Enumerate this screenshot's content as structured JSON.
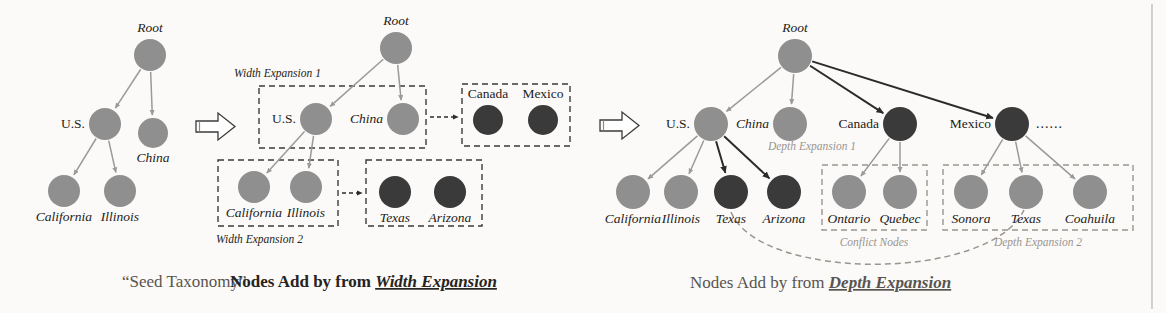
{
  "figure": {
    "colors": {
      "node_light": "#8f8f8f",
      "node_dark": "#3a3a3a",
      "edge_light": "#9a9a9a",
      "edge_dark": "#2b2b2b",
      "dash_box": "#3a3a3a",
      "dash_box_grey": "#9a958f",
      "caption_grey": "#9a958f",
      "caption_dark": "#262320",
      "background": "#fbfaf8"
    }
  },
  "panels": [
    {
      "id": "seed",
      "caption": "“Seed Taxonomy”",
      "caption_style": "grey",
      "nodes": [
        {
          "name": "Root",
          "label": "Root",
          "x": 150,
          "y": 55,
          "r": 16,
          "tone": "light",
          "label_pos": "above"
        },
        {
          "name": "US",
          "label": "U.S.",
          "x": 105,
          "y": 124,
          "r": 16,
          "tone": "light",
          "label_pos": "left"
        },
        {
          "name": "China",
          "label": "China",
          "x": 153,
          "y": 133,
          "r": 15,
          "tone": "light",
          "label_pos": "below"
        },
        {
          "name": "California",
          "label": "California",
          "x": 64,
          "y": 191,
          "r": 16,
          "tone": "light",
          "label_pos": "below"
        },
        {
          "name": "Illinois",
          "label": "Illinois",
          "x": 120,
          "y": 191,
          "r": 16,
          "tone": "light",
          "label_pos": "below"
        }
      ],
      "edges": [
        {
          "from": "Root",
          "to": "US",
          "tone": "light"
        },
        {
          "from": "Root",
          "to": "China",
          "tone": "light"
        },
        {
          "from": "US",
          "to": "California",
          "tone": "light"
        },
        {
          "from": "US",
          "to": "Illinois",
          "tone": "light"
        }
      ]
    },
    {
      "id": "width-expansion",
      "caption_prefix": "Nodes Add by from ",
      "caption_emphasis": "Width Expansion",
      "caption_style": "bold",
      "nodes": [
        {
          "name": "Root",
          "label": "Root",
          "x": 396,
          "y": 48,
          "r": 16,
          "tone": "light",
          "label_pos": "above"
        },
        {
          "name": "US",
          "label": "U.S.",
          "x": 316,
          "y": 119,
          "r": 16,
          "tone": "light",
          "label_pos": "left"
        },
        {
          "name": "China",
          "label": "China",
          "x": 403,
          "y": 119,
          "r": 16,
          "tone": "light",
          "label_pos": "left"
        },
        {
          "name": "Canada",
          "label": "Canada",
          "x": 488,
          "y": 120,
          "r": 15,
          "tone": "dark",
          "label_pos": "above"
        },
        {
          "name": "Mexico",
          "label": "Mexico",
          "x": 543,
          "y": 120,
          "r": 15,
          "tone": "dark",
          "label_pos": "above"
        },
        {
          "name": "California",
          "label": "California",
          "x": 254,
          "y": 187,
          "r": 16,
          "tone": "light",
          "label_pos": "below"
        },
        {
          "name": "Illinois",
          "label": "Illinois",
          "x": 306,
          "y": 187,
          "r": 16,
          "tone": "light",
          "label_pos": "below"
        },
        {
          "name": "Texas",
          "label": "Texas",
          "x": 395,
          "y": 192,
          "r": 16,
          "tone": "dark",
          "label_pos": "below"
        },
        {
          "name": "Arizona",
          "label": "Arizona",
          "x": 450,
          "y": 192,
          "r": 16,
          "tone": "dark",
          "label_pos": "below"
        }
      ],
      "edges": [
        {
          "from": "Root",
          "to": "US",
          "tone": "light"
        },
        {
          "from": "Root",
          "to": "China",
          "tone": "light"
        },
        {
          "from": "US",
          "to": "California",
          "tone": "light"
        },
        {
          "from": "US",
          "to": "Illinois",
          "tone": "light"
        }
      ],
      "boxes": [
        {
          "name": "width-expansion-1-box",
          "x": 259,
          "y": 86,
          "w": 167,
          "h": 62,
          "label": "Width Expansion 1",
          "label_x": 234,
          "label_y": 77,
          "label_anchor": "start",
          "tone": "dark"
        },
        {
          "name": "new-top-nodes-box",
          "x": 462,
          "y": 84,
          "w": 108,
          "h": 62,
          "label": "",
          "tone": "dark"
        },
        {
          "name": "width-expansion-2-box",
          "x": 218,
          "y": 160,
          "w": 120,
          "h": 66,
          "label": "Width Expansion 2",
          "label_x": 216,
          "label_y": 243,
          "label_anchor": "start",
          "tone": "dark"
        },
        {
          "name": "new-leaf-nodes-box",
          "x": 366,
          "y": 160,
          "w": 116,
          "h": 66,
          "label": "",
          "tone": "dark"
        }
      ],
      "dashed_arrows": [
        {
          "name": "top-expansion-arrow",
          "x1": 430,
          "y1": 117,
          "x2": 458,
          "y2": 117
        },
        {
          "name": "leaf-expansion-arrow",
          "x1": 342,
          "y1": 193,
          "x2": 362,
          "y2": 193
        }
      ]
    },
    {
      "id": "depth-expansion",
      "caption_prefix": "Nodes Add by from ",
      "caption_emphasis": "Depth Expansion",
      "caption_style": "grey",
      "ellipsis": {
        "text": "......",
        "x": 1036,
        "y": 128
      },
      "nodes": [
        {
          "name": "Root",
          "label": "Root",
          "x": 795,
          "y": 56,
          "r": 17,
          "tone": "light",
          "label_pos": "above"
        },
        {
          "name": "US",
          "label": "U.S.",
          "x": 711,
          "y": 124,
          "r": 17,
          "tone": "light",
          "label_pos": "left"
        },
        {
          "name": "China",
          "label": "China",
          "x": 790,
          "y": 124,
          "r": 17,
          "tone": "light",
          "label_pos": "left"
        },
        {
          "name": "Canada",
          "label": "Canada",
          "x": 900,
          "y": 124,
          "r": 17,
          "tone": "dark",
          "label_pos": "left"
        },
        {
          "name": "Mexico",
          "label": "Mexico",
          "x": 1012,
          "y": 124,
          "r": 17,
          "tone": "dark",
          "label_pos": "left"
        },
        {
          "name": "California",
          "label": "California",
          "x": 633,
          "y": 192,
          "r": 17,
          "tone": "light",
          "label_pos": "below"
        },
        {
          "name": "Illinois",
          "label": "Illinois",
          "x": 681,
          "y": 192,
          "r": 17,
          "tone": "light",
          "label_pos": "below"
        },
        {
          "name": "TexasUS",
          "label": "Texas",
          "x": 731,
          "y": 192,
          "r": 17,
          "tone": "dark",
          "label_pos": "below"
        },
        {
          "name": "Arizona",
          "label": "Arizona",
          "x": 784,
          "y": 192,
          "r": 17,
          "tone": "dark",
          "label_pos": "below"
        },
        {
          "name": "Ontario",
          "label": "Ontario",
          "x": 849,
          "y": 192,
          "r": 17,
          "tone": "light",
          "label_pos": "below"
        },
        {
          "name": "Quebec",
          "label": "Quebec",
          "x": 900,
          "y": 192,
          "r": 17,
          "tone": "light",
          "label_pos": "below"
        },
        {
          "name": "Sonora",
          "label": "Sonora",
          "x": 971,
          "y": 192,
          "r": 17,
          "tone": "light",
          "label_pos": "below"
        },
        {
          "name": "TexasMX",
          "label": "Texas",
          "x": 1026,
          "y": 192,
          "r": 17,
          "tone": "light",
          "label_pos": "below"
        },
        {
          "name": "Coahuila",
          "label": "Coahuila",
          "x": 1090,
          "y": 192,
          "r": 17,
          "tone": "light",
          "label_pos": "below"
        }
      ],
      "edges": [
        {
          "from": "Root",
          "to": "US",
          "tone": "light"
        },
        {
          "from": "Root",
          "to": "China",
          "tone": "light"
        },
        {
          "from": "Root",
          "to": "Canada",
          "tone": "dark"
        },
        {
          "from": "Root",
          "to": "Mexico",
          "tone": "dark"
        },
        {
          "from": "US",
          "to": "California",
          "tone": "light"
        },
        {
          "from": "US",
          "to": "Illinois",
          "tone": "light"
        },
        {
          "from": "US",
          "to": "TexasUS",
          "tone": "dark"
        },
        {
          "from": "US",
          "to": "Arizona",
          "tone": "dark"
        },
        {
          "from": "Canada",
          "to": "Ontario",
          "tone": "light"
        },
        {
          "from": "Canada",
          "to": "Quebec",
          "tone": "light"
        },
        {
          "from": "Mexico",
          "to": "Sonora",
          "tone": "light"
        },
        {
          "from": "Mexico",
          "to": "TexasMX",
          "tone": "light"
        },
        {
          "from": "Mexico",
          "to": "Coahuila",
          "tone": "light"
        }
      ],
      "boxes": [
        {
          "name": "conflict-nodes-box",
          "x": 822,
          "y": 165,
          "w": 105,
          "h": 65,
          "label": "Conflict Nodes",
          "label_x": 874,
          "label_y": 246,
          "label_anchor": "middle",
          "tone": "grey"
        },
        {
          "name": "depth-expansion-2-box",
          "x": 943,
          "y": 165,
          "w": 190,
          "h": 65,
          "label": "Depth Expansion 2",
          "label_x": 1038,
          "label_y": 246,
          "label_anchor": "middle",
          "tone": "grey"
        }
      ],
      "annotations": [
        {
          "name": "depth-expansion-1-label",
          "text": "Depth Expansion 1",
          "x": 812,
          "y": 150,
          "anchor": "middle"
        }
      ],
      "conflict_link": {
        "name": "conflict-curve",
        "from": "TexasUS",
        "to": "TexasMX",
        "path": "M 731 212 C 760 282, 990 282, 1024 210"
      }
    }
  ],
  "flow_arrows": [
    {
      "name": "flow-arrow-1",
      "x": 196,
      "y": 112
    },
    {
      "name": "flow-arrow-2",
      "x": 600,
      "y": 111
    }
  ],
  "captions": [
    {
      "name": "caption-seed",
      "text": "“Seed Taxonomy”",
      "x": 122,
      "y": 287,
      "style": "grey"
    },
    {
      "name": "caption-width",
      "prefix": "Nodes Add by from ",
      "emphasis": "Width Expansion",
      "x": 230,
      "y": 287,
      "style": "bold"
    },
    {
      "name": "caption-depth",
      "prefix": "Nodes Add by from ",
      "emphasis": "Depth Expansion",
      "x": 690,
      "y": 288,
      "style": "grey"
    }
  ]
}
